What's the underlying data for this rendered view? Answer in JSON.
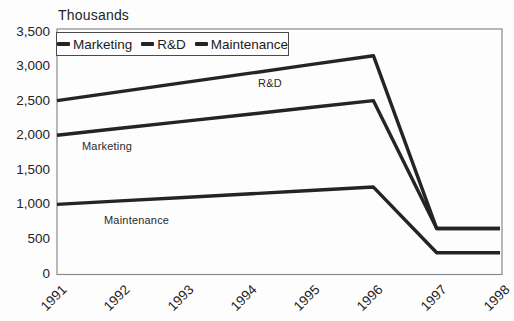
{
  "title": "Thousands",
  "legend": {
    "items": [
      {
        "label": "Marketing"
      },
      {
        "label": "R&D"
      },
      {
        "label": "Maintenance"
      }
    ]
  },
  "chart_data": {
    "type": "line",
    "title": "Thousands",
    "categories": [
      "1991",
      "1992",
      "1993",
      "1994",
      "1995",
      "1996",
      "1997",
      "1998"
    ],
    "series": [
      {
        "name": "Marketing",
        "values": [
          2000,
          2100,
          2200,
          2300,
          2400,
          2500,
          650,
          650
        ]
      },
      {
        "name": "R&D",
        "values": [
          2500,
          2630,
          2760,
          2890,
          3020,
          3150,
          650,
          650
        ]
      },
      {
        "name": "Maintenance",
        "values": [
          1000,
          1050,
          1100,
          1150,
          1200,
          1250,
          300,
          300
        ]
      }
    ],
    "ylim": [
      0,
      3500
    ],
    "ytick_step": 500,
    "yticks": [
      {
        "value": 0,
        "label": "0"
      },
      {
        "value": 500,
        "label": "500"
      },
      {
        "value": 1000,
        "label": "1,000"
      },
      {
        "value": 1500,
        "label": "1,500"
      },
      {
        "value": 2000,
        "label": "2,000"
      },
      {
        "value": 2500,
        "label": "2,500"
      },
      {
        "value": 3000,
        "label": "3,000"
      },
      {
        "value": 3500,
        "label": "3,500"
      }
    ],
    "xlabel": "",
    "ylabel": "Thousands",
    "grid": false,
    "legend_position": "inside-top-left",
    "line_color": "#242424",
    "plot_border_color": "#8a8a8a",
    "annotations": [
      {
        "text": "Marketing"
      },
      {
        "text": "R&D"
      },
      {
        "text": "Maintenance"
      }
    ]
  }
}
